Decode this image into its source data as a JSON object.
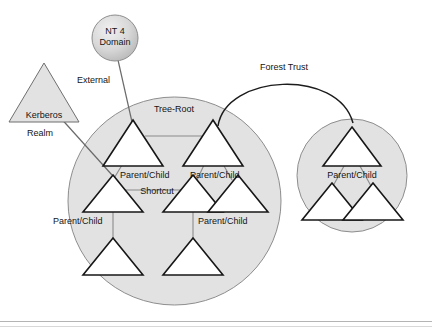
{
  "diagram": {
    "colors": {
      "circle_fill": "#e2e2e2",
      "circle_stroke": "#8d8d8d",
      "triangle_fill": "#ffffff",
      "triangle_stroke": "#171717",
      "connector": "#8a8a8a",
      "arc": "#1c1c1c",
      "text": "#141414",
      "background": "#ffffff"
    },
    "nodes": {
      "nt4_domain": {
        "line1": "NT 4",
        "line2": "Domain"
      },
      "kerberos_realm": {
        "line1": "Kerberos",
        "line2": "Realm"
      }
    },
    "labels": {
      "external": "External",
      "forest_trust": "Forest Trust",
      "tree_root": "Tree-Root",
      "shortcut": "Shortcut",
      "parent_child_1": "Parent/Child",
      "parent_child_2": "Parent/Child",
      "parent_child_3": "Parent/Child",
      "parent_child_4": "Parent/Child",
      "parent_child_5": "Parent/Child"
    }
  }
}
